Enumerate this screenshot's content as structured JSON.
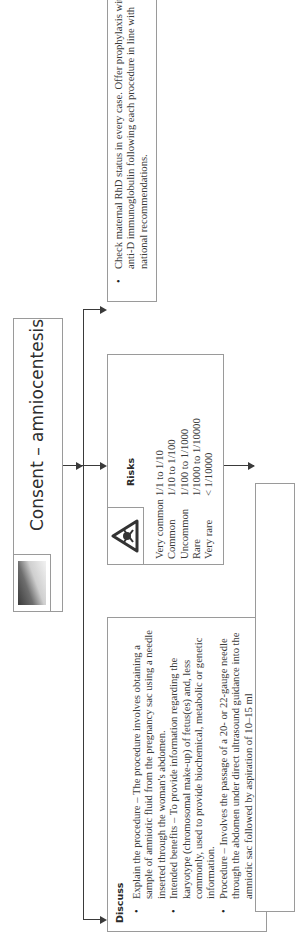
{
  "header": {
    "title": "Consent – amniocentesis",
    "image_icon": "pregnant-abdomen-photo"
  },
  "discuss": {
    "heading": "Discuss",
    "items": [
      "Explain the procedure – The procedure involves obtaining a sample of amniotic fluid from the pregnancy sac using a needle inserted through the woman's abdomen.",
      "Intended benefits – To provide information regarding the karyotype (chromosomal make-up) of fetus(es) and, less commonly, used to provide biochemical, metabolic or genetic information.",
      "Procedure – Involves the passage of a 20- or 22-gauge needle through the abdomen under direct ultrasound guidance into the amniotic sac followed by aspiration of 10–15 ml"
    ]
  },
  "risks": {
    "heading": "Risks",
    "icon": "hazard-warning-icon",
    "rows": [
      {
        "label": "Very common",
        "value": "1/1 to 1/10"
      },
      {
        "label": "Common",
        "value": "1/10 to 1/100"
      },
      {
        "label": "Uncommon",
        "value": "1/100 to 1/1000"
      },
      {
        "label": "Rare",
        "value": "1/1000 to 1/10000"
      },
      {
        "label": "Very rare",
        "value": "< 1/10000"
      }
    ]
  },
  "rhd": {
    "items": [
      "Check maternal RhD status in every case. Offer prophylaxis with anti-D immunoglobulin following each procedure in line with national recommendations."
    ]
  }
}
